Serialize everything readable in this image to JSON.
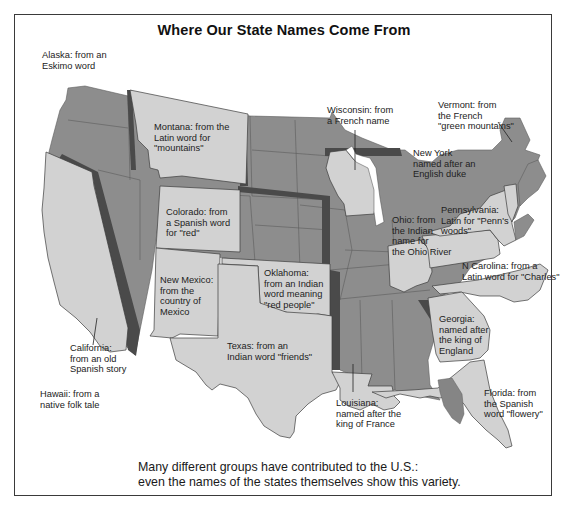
{
  "title": "Where Our State Names Come From",
  "caption": {
    "line1": "Many different groups have contributed to the U.S.:",
    "line2": "even the names of the states themselves show this variety."
  },
  "colors": {
    "highlighted_state": "#d2d2d2",
    "other_state": "#8d8d8d",
    "border_shadow": "#4a4a4a",
    "text": "#222222",
    "frame": "#3a3a3a"
  },
  "labels": {
    "alaska": "Alaska: from an\nEskimo word",
    "montana": "Montana: from the\nLatin word for\n\"mountains\"",
    "wisconsin": "Wisconsin: from\na French name",
    "vermont": "Vermont: from\nthe French\n\"green mountains\"",
    "new_york": "New York\nnamed after an\nEnglish duke",
    "pennsylvania": "Pennsylvania:\nLatin for \"Penn's\nwoods\"",
    "ohio": "Ohio: from\nthe Indian\nname for\nthe Ohio River",
    "colorado": "Colorado: from\na Spanish word\nfor \"red\"",
    "new_mexico": "New Mexico:\nfrom the\ncountry of\nMexico",
    "oklahoma": "Oklahoma:\nfrom an Indian\nword meaning\n\"red people\"",
    "n_carolina": "N Carolina: from a\nLatin word for \"Charles\"",
    "georgia": "Georgia:\nnamed after\nthe king of\nEngland",
    "california": "California:\nfrom an old\nSpanish story",
    "texas": "Texas: from an\nIndian word \"friends\"",
    "hawaii": "Hawaii: from a\nnative folk tale",
    "louisiana": "Louisiana:\nnamed after the\nking of France",
    "florida": "Florida: from\nthe Spanish\nword \"flowery\""
  },
  "highlighted_states": [
    "Montana",
    "Wisconsin",
    "Vermont",
    "New York",
    "Pennsylvania",
    "Ohio",
    "Colorado",
    "New Mexico",
    "Oklahoma",
    "North Carolina",
    "Georgia",
    "California",
    "Texas",
    "Louisiana",
    "Florida"
  ]
}
